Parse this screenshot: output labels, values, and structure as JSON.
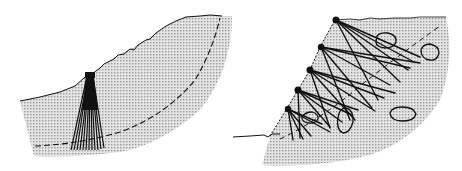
{
  "diagram": {
    "colors": {
      "background": "#ffffff",
      "soil_fill": "#d8d8d8",
      "soil_dot": "#9a9a9a",
      "line": "#111111"
    },
    "left_panel": {
      "name": "pile-group-slope",
      "ground_surface": [
        [
          20,
          101
        ],
        [
          40,
          97
        ],
        [
          60,
          92
        ],
        [
          75,
          86
        ],
        [
          84,
          78
        ],
        [
          92,
          74
        ],
        [
          100,
          68
        ],
        [
          108,
          62
        ],
        [
          118,
          55
        ],
        [
          130,
          49
        ],
        [
          138,
          45
        ],
        [
          146,
          40
        ],
        [
          156,
          33
        ],
        [
          166,
          26
        ],
        [
          176,
          21
        ],
        [
          186,
          17
        ],
        [
          200,
          16
        ],
        [
          210,
          15
        ],
        [
          222,
          16
        ]
      ],
      "slip_surface": [
        [
          35,
          146
        ],
        [
          60,
          144
        ],
        [
          90,
          140
        ],
        [
          120,
          132
        ],
        [
          150,
          120
        ],
        [
          175,
          102
        ],
        [
          195,
          80
        ],
        [
          210,
          50
        ],
        [
          220,
          18
        ]
      ],
      "pile_cap": {
        "x": 85,
        "y": 73,
        "w": 10,
        "h": 5
      },
      "piles_bottom_x": [
        71,
        74,
        77,
        80,
        83,
        86,
        89,
        92,
        95,
        98,
        101,
        104
      ],
      "piles_bottom_y": 150
    },
    "right_panel": {
      "name": "anchored-slope",
      "ground_left": [
        [
          233,
          137
        ],
        [
          250,
          136
        ],
        [
          264,
          135
        ],
        [
          270,
          136
        ]
      ],
      "slope_face": [
        [
          270,
          136
        ],
        [
          286,
          110
        ],
        [
          298,
          90
        ],
        [
          310,
          70
        ],
        [
          320,
          47
        ],
        [
          335,
          20
        ]
      ],
      "ground_top": [
        [
          335,
          20
        ],
        [
          380,
          18
        ],
        [
          420,
          18
        ],
        [
          446,
          17
        ]
      ],
      "slip_line": [
        [
          280,
          139
        ],
        [
          300,
          130
        ],
        [
          330,
          112
        ],
        [
          360,
          86
        ],
        [
          390,
          62
        ],
        [
          420,
          44
        ],
        [
          440,
          26
        ]
      ],
      "anchor_heads": [
        {
          "x": 288,
          "y": 109
        },
        {
          "x": 298,
          "y": 90
        },
        {
          "x": 310,
          "y": 70
        },
        {
          "x": 321,
          "y": 47
        },
        {
          "x": 336,
          "y": 20
        }
      ],
      "anchors": [
        [
          [
            288,
            109
          ],
          [
            293,
            140
          ]
        ],
        [
          [
            288,
            109
          ],
          [
            303,
            139
          ]
        ],
        [
          [
            288,
            109
          ],
          [
            311,
            136
          ]
        ],
        [
          [
            288,
            109
          ],
          [
            330,
            132
          ]
        ],
        [
          [
            288,
            109
          ],
          [
            322,
            124
          ]
        ],
        [
          [
            298,
            90
          ],
          [
            300,
            138
          ]
        ],
        [
          [
            298,
            90
          ],
          [
            330,
            127
          ]
        ],
        [
          [
            298,
            90
          ],
          [
            342,
            122
          ]
        ],
        [
          [
            298,
            90
          ],
          [
            352,
            115
          ]
        ],
        [
          [
            298,
            90
          ],
          [
            358,
            110
          ]
        ],
        [
          [
            310,
            70
          ],
          [
            330,
            128
          ]
        ],
        [
          [
            310,
            70
          ],
          [
            355,
            120
          ]
        ],
        [
          [
            310,
            70
          ],
          [
            375,
            111
          ]
        ],
        [
          [
            310,
            70
          ],
          [
            384,
            98
          ]
        ],
        [
          [
            310,
            70
          ],
          [
            395,
            93
          ]
        ],
        [
          [
            321,
            47
          ],
          [
            350,
            120
          ]
        ],
        [
          [
            321,
            47
          ],
          [
            372,
            108
          ]
        ],
        [
          [
            321,
            47
          ],
          [
            390,
            85
          ]
        ],
        [
          [
            321,
            47
          ],
          [
            410,
            68
          ]
        ],
        [
          [
            321,
            47
          ],
          [
            420,
            63
          ]
        ],
        [
          [
            336,
            20
          ],
          [
            378,
            100
          ]
        ],
        [
          [
            336,
            20
          ],
          [
            400,
            82
          ]
        ],
        [
          [
            336,
            20
          ],
          [
            414,
            62
          ]
        ],
        [
          [
            336,
            20
          ],
          [
            420,
            57
          ]
        ],
        [
          [
            336,
            20
          ],
          [
            418,
            65
          ]
        ]
      ],
      "boulders": [
        {
          "cx": 386,
          "cy": 40,
          "rx": 11,
          "ry": 8
        },
        {
          "cx": 430,
          "cy": 52,
          "rx": 10,
          "ry": 9
        },
        {
          "cx": 403,
          "cy": 114,
          "rx": 13,
          "ry": 7
        },
        {
          "cx": 345,
          "cy": 120,
          "rx": 8,
          "ry": 12
        },
        {
          "cx": 310,
          "cy": 118,
          "rx": 9,
          "ry": 6
        }
      ]
    }
  }
}
